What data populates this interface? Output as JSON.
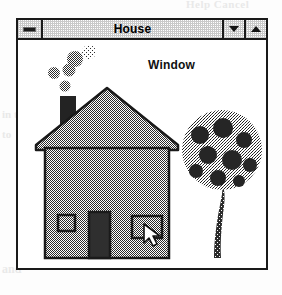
{
  "window": {
    "title": "House",
    "sysmenu_icon": "system-menu-icon",
    "minimize_icon": "triangle-down-icon",
    "maximize_icon": "triangle-up-icon"
  },
  "canvas": {
    "label": "Window",
    "cursor_icon": "arrow-cursor",
    "drawing": {
      "name": "house-scene",
      "elements": [
        "chimney",
        "smoke-puffs",
        "roof",
        "house-body",
        "small-window",
        "door",
        "large-window",
        "tree"
      ],
      "smoke_puff_count": 5
    }
  },
  "colors": {
    "outline": "#1a1a1a",
    "wall_fill": "#8a8a8a",
    "roof_fill": "#8a8a8a",
    "door_fill": "#2a2a2a",
    "chimney_fill": "#232323",
    "canvas_bg": "#ffffff",
    "titlebar_bg": "#e2e2e2"
  },
  "bleed": {
    "top": "Help Cancel",
    "mid1": "in the",
    "mid2": "to",
    "bottom": "and"
  }
}
